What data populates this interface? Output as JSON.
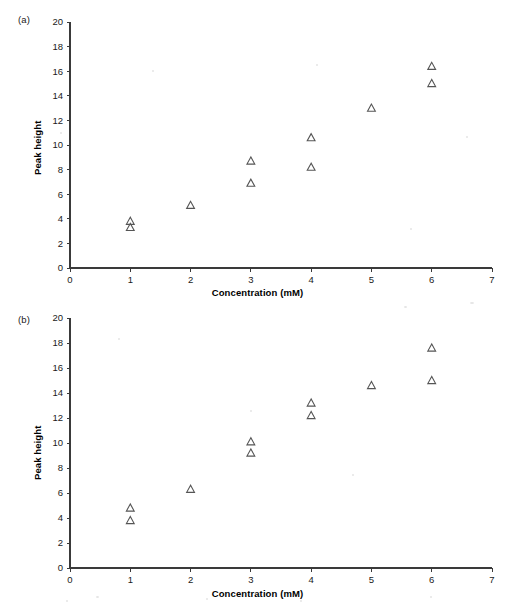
{
  "figure": {
    "panels": [
      {
        "tag": "(a)",
        "xlabel": "Concentration (mM)",
        "ylabel": "Peak height"
      },
      {
        "tag": "(b)",
        "xlabel": "Concentration (mM)",
        "ylabel": "Peak height"
      }
    ],
    "marker_color": "#555555",
    "axis_color": "#3a3a3a"
  },
  "chart_data": [
    {
      "type": "scatter",
      "panel": "(a)",
      "title": "",
      "xlabel": "Concentration (mM)",
      "ylabel": "Peak height",
      "xlim": [
        0,
        7
      ],
      "ylim": [
        0,
        20
      ],
      "xticks": [
        0,
        1,
        2,
        3,
        4,
        5,
        6,
        7
      ],
      "yticks": [
        0,
        2,
        4,
        6,
        8,
        10,
        12,
        14,
        16,
        18,
        20
      ],
      "xticklabels": [
        "0",
        "1",
        "2",
        "3",
        "4",
        "5",
        "6",
        "7"
      ],
      "yticklabels": [
        "0",
        "2",
        "4",
        "6",
        "8",
        "10",
        "12",
        "14",
        "16",
        "18",
        "20"
      ],
      "grid": false,
      "legend": false,
      "marker": "triangle-up-open",
      "points": [
        {
          "x": 1,
          "y": 3.8
        },
        {
          "x": 1,
          "y": 3.3
        },
        {
          "x": 2,
          "y": 5.1
        },
        {
          "x": 3,
          "y": 8.7
        },
        {
          "x": 3,
          "y": 6.9
        },
        {
          "x": 4,
          "y": 10.6
        },
        {
          "x": 4,
          "y": 8.2
        },
        {
          "x": 5,
          "y": 13.0
        },
        {
          "x": 6,
          "y": 16.4
        },
        {
          "x": 6,
          "y": 15.0
        }
      ]
    },
    {
      "type": "scatter",
      "panel": "(b)",
      "title": "",
      "xlabel": "Concentration (mM)",
      "ylabel": "Peak height",
      "xlim": [
        0,
        7
      ],
      "ylim": [
        0,
        20
      ],
      "xticks": [
        0,
        1,
        2,
        3,
        4,
        5,
        6,
        7
      ],
      "yticks": [
        0,
        2,
        4,
        6,
        8,
        10,
        12,
        14,
        16,
        18,
        20
      ],
      "xticklabels": [
        "0",
        "1",
        "2",
        "3",
        "4",
        "5",
        "6",
        "7"
      ],
      "yticklabels": [
        "0",
        "2",
        "4",
        "6",
        "8",
        "10",
        "12",
        "14",
        "16",
        "18",
        "20"
      ],
      "grid": false,
      "legend": false,
      "marker": "triangle-up-open",
      "points": [
        {
          "x": 1,
          "y": 4.8
        },
        {
          "x": 1,
          "y": 3.8
        },
        {
          "x": 2,
          "y": 6.3
        },
        {
          "x": 3,
          "y": 10.1
        },
        {
          "x": 3,
          "y": 9.2
        },
        {
          "x": 4,
          "y": 13.2
        },
        {
          "x": 4,
          "y": 12.2
        },
        {
          "x": 5,
          "y": 14.6
        },
        {
          "x": 6,
          "y": 17.6
        },
        {
          "x": 6,
          "y": 15.0
        }
      ]
    }
  ]
}
